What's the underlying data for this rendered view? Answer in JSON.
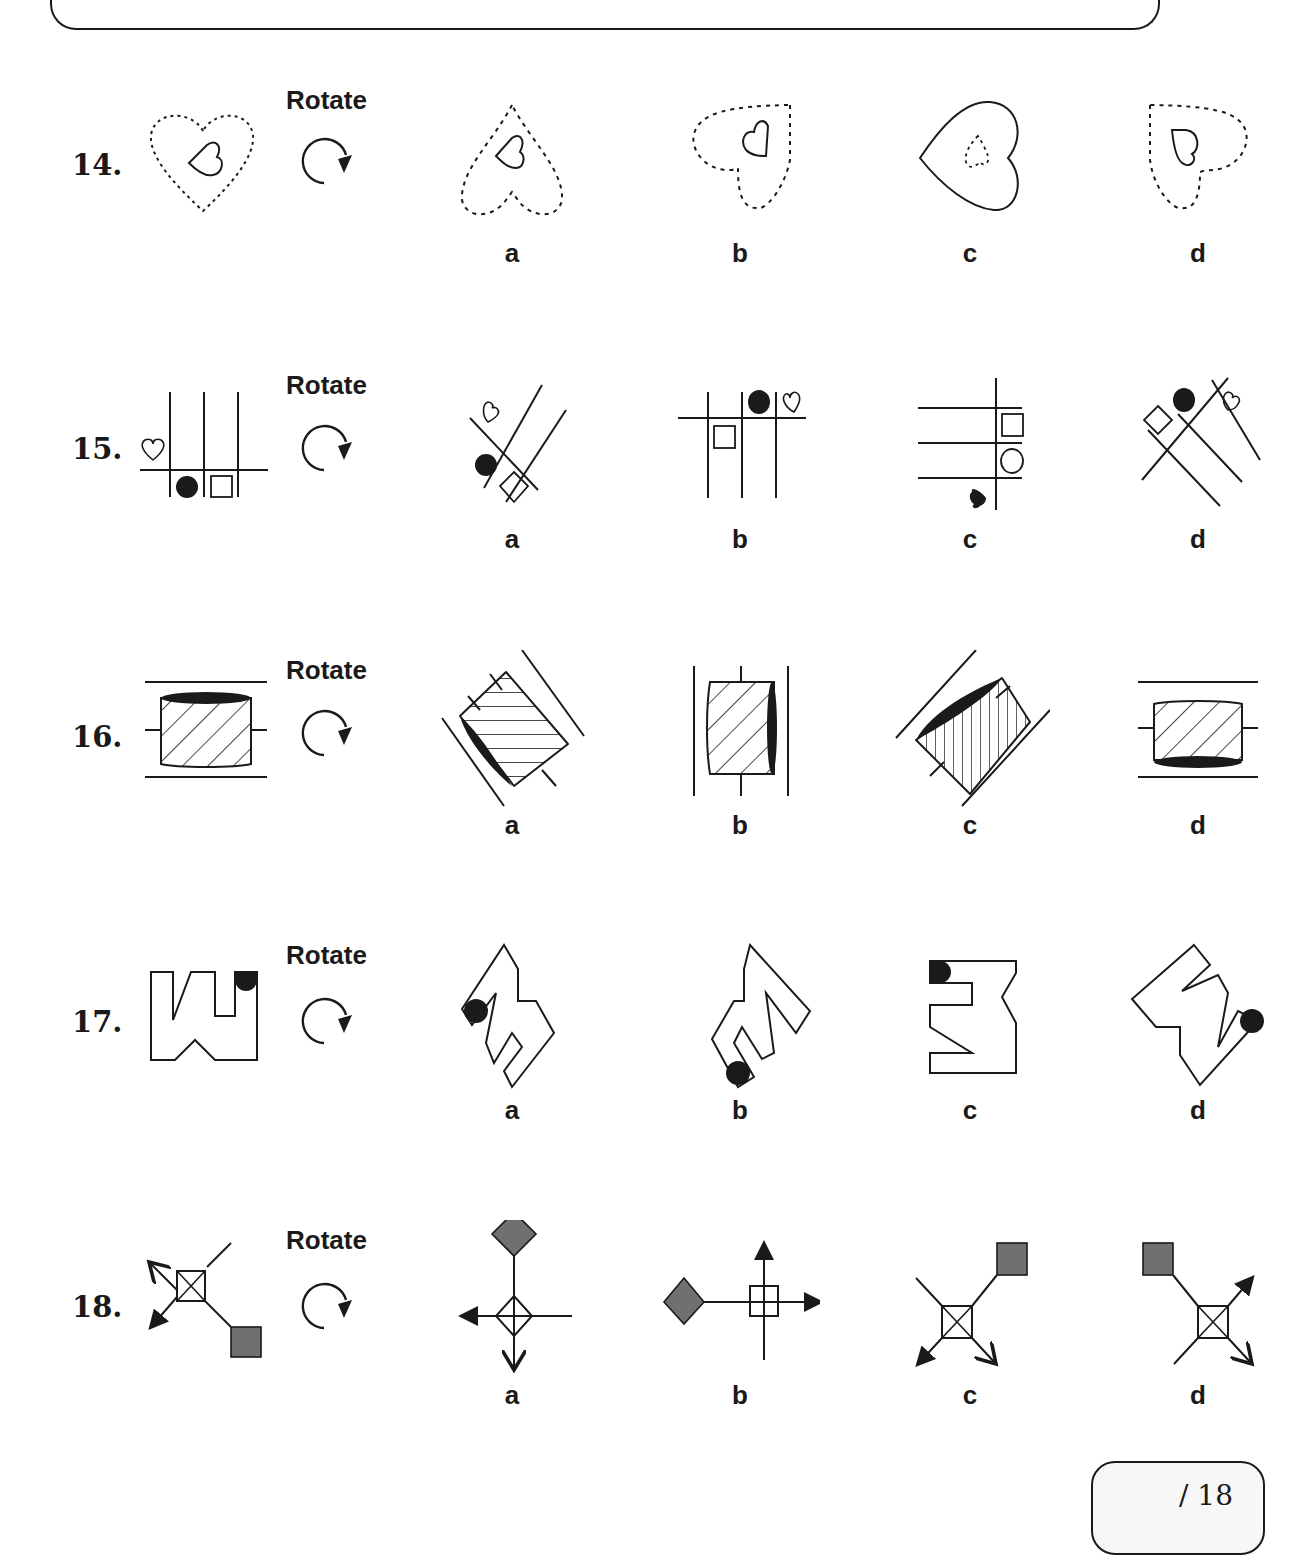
{
  "page": {
    "score_text": "/ 18"
  },
  "rotate": {
    "label": "Rotate",
    "icon": "clockwise-arrow-icon"
  },
  "questions": [
    {
      "number": "14.",
      "figure": "dotted-heart-with-small-solid-heart",
      "options": [
        {
          "label": "a",
          "figure": "dotted-heart-upside-down"
        },
        {
          "label": "b",
          "figure": "dotted-heart-rotated"
        },
        {
          "label": "c",
          "figure": "solid-heart-rotated-with-dotted-inner"
        },
        {
          "label": "d",
          "figure": "dotted-heart-rotated-mirror"
        }
      ]
    },
    {
      "number": "15.",
      "figure": "grid-lines-with-heart-circle-square",
      "options": [
        {
          "label": "a",
          "figure": "diagonal-lines-heart-circle-diamond"
        },
        {
          "label": "b",
          "figure": "grid-lines-square-circle-heart"
        },
        {
          "label": "c",
          "figure": "horizontal-lines-square-circle-heart"
        },
        {
          "label": "d",
          "figure": "diagonal-lines-diamond-circle-heart"
        }
      ]
    },
    {
      "number": "16.",
      "figure": "hatched-cylinder-between-lines",
      "options": [
        {
          "label": "a",
          "figure": "tilted-cylinder-horizontal-hatch"
        },
        {
          "label": "b",
          "figure": "vertical-cylinder-right-dark"
        },
        {
          "label": "c",
          "figure": "tilted-cylinder-vertical-hatch"
        },
        {
          "label": "d",
          "figure": "cylinder-bottom-dark"
        }
      ]
    },
    {
      "number": "17.",
      "figure": "notched-shape-with-dot",
      "options": [
        {
          "label": "a",
          "figure": "rotated-notched-shape-dot-left"
        },
        {
          "label": "b",
          "figure": "rotated-notched-shape-dot-bottom"
        },
        {
          "label": "c",
          "figure": "notched-shape-dot-top-left"
        },
        {
          "label": "d",
          "figure": "rotated-notched-shape-dot-right"
        }
      ]
    },
    {
      "number": "18.",
      "figure": "crossed-square-arrows-grey-square",
      "options": [
        {
          "label": "a",
          "figure": "diamond-cross-arrows-grey-diamond-top"
        },
        {
          "label": "b",
          "figure": "square-cross-arrows-grey-diamond-left"
        },
        {
          "label": "c",
          "figure": "crossed-square-grey-square-top-right"
        },
        {
          "label": "d",
          "figure": "crossed-square-grey-square-top-left"
        }
      ]
    }
  ],
  "colors": {
    "ink": "#1a1a1a",
    "grey_fill": "#707070",
    "score_bg": "#f7f7f7"
  }
}
